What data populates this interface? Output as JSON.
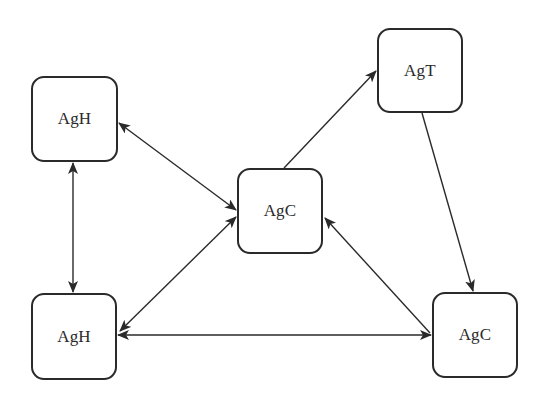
{
  "diagram": {
    "type": "network",
    "colors": {
      "stroke": "#2a2a2a",
      "background": "#ffffff"
    },
    "nodes": [
      {
        "id": "agh_top",
        "label": "AgH",
        "x": 31,
        "y": 76,
        "w": 87,
        "h": 86
      },
      {
        "id": "agt",
        "label": "AgT",
        "x": 377,
        "y": 28,
        "w": 86,
        "h": 85
      },
      {
        "id": "agc_center",
        "label": "AgC",
        "x": 237,
        "y": 168,
        "w": 86,
        "h": 86
      },
      {
        "id": "agh_bottom",
        "label": "AgH",
        "x": 31,
        "y": 293,
        "w": 86,
        "h": 87
      },
      {
        "id": "agc_right",
        "label": "AgC",
        "x": 432,
        "y": 292,
        "w": 86,
        "h": 86
      }
    ],
    "edges": [
      {
        "from": "agh_top",
        "to": "agc_center",
        "direction": "both",
        "x1": 119,
        "y1": 123,
        "x2": 236,
        "y2": 210
      },
      {
        "from": "agh_top",
        "to": "agh_bottom",
        "direction": "both",
        "x1": 73,
        "y1": 163,
        "x2": 73,
        "y2": 292
      },
      {
        "from": "agh_bottom",
        "to": "agc_center",
        "direction": "both",
        "x1": 120,
        "y1": 331,
        "x2": 236,
        "y2": 217
      },
      {
        "from": "agh_bottom",
        "to": "agc_right",
        "direction": "both",
        "x1": 118,
        "y1": 335,
        "x2": 431,
        "y2": 335
      },
      {
        "from": "agc_center",
        "to": "agt",
        "direction": "forward",
        "x1": 284,
        "y1": 168,
        "x2": 376,
        "y2": 71
      },
      {
        "from": "agt",
        "to": "agc_right",
        "direction": "forward",
        "x1": 422,
        "y1": 113,
        "x2": 473,
        "y2": 291
      },
      {
        "from": "agc_right",
        "to": "agc_center",
        "direction": "forward",
        "x1": 430,
        "y1": 333,
        "x2": 325,
        "y2": 218
      }
    ]
  }
}
